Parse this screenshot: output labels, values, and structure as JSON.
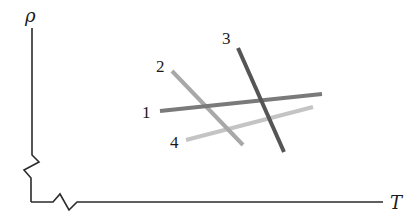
{
  "diagram": {
    "y_axis_label": "ρ",
    "x_axis_label": "T",
    "axis_breaks": [
      "y-axis zigzag break",
      "x-axis zigzag break"
    ],
    "lines": [
      {
        "label": "1",
        "x1": 160,
        "y1": 111,
        "x2": 322,
        "y2": 94,
        "color": "#7a7a7a",
        "label_x": 147,
        "label_y": 118
      },
      {
        "label": "2",
        "x1": 172,
        "y1": 71,
        "x2": 243,
        "y2": 145,
        "color": "#a8a8a8",
        "label_x": 161,
        "label_y": 72
      },
      {
        "label": "3",
        "x1": 238,
        "y1": 48,
        "x2": 284,
        "y2": 152,
        "color": "#555555",
        "label_x": 227,
        "label_y": 44
      },
      {
        "label": "4",
        "x1": 186,
        "y1": 140,
        "x2": 313,
        "y2": 107,
        "color": "#c4c4c4",
        "label_x": 175,
        "label_y": 148
      }
    ]
  }
}
